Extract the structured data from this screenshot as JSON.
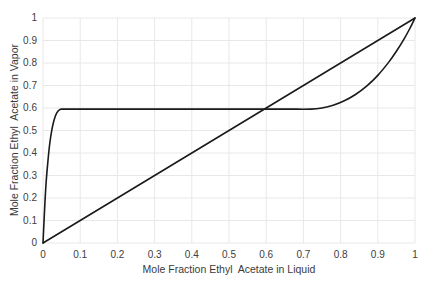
{
  "chart_data": {
    "type": "line",
    "title": "",
    "xlabel": "Mole Fraction Ethyl  Acetate in Liquid",
    "ylabel": "Mole Fraction Ethyl  Acetate in Vapor",
    "xlim": [
      0,
      1
    ],
    "ylim": [
      0,
      1
    ],
    "grid": true,
    "legend": "none",
    "xticks": [
      "0",
      "0.1",
      "0.2",
      "0.3",
      "0.4",
      "0.5",
      "0.6",
      "0.7",
      "0.8",
      "0.9",
      "1"
    ],
    "xtick_values": [
      0,
      0.1,
      0.2,
      0.3,
      0.4,
      0.5,
      0.6,
      0.7,
      0.8,
      0.9,
      1
    ],
    "yticks": [
      "0",
      "0.1",
      "0.2",
      "0.3",
      "0.4",
      "0.5",
      "0.6",
      "0.7",
      "0.8",
      "0.9",
      "1"
    ],
    "ytick_values": [
      0,
      0.1,
      0.2,
      0.3,
      0.4,
      0.5,
      0.6,
      0.7,
      0.8,
      0.9,
      1
    ],
    "series": [
      {
        "name": "equilibrium-curve",
        "color": "#1a1a1a",
        "x": [
          0,
          0.004,
          0.008,
          0.013,
          0.018,
          0.024,
          0.03,
          0.037,
          0.045,
          0.052,
          0.06,
          0.1,
          0.2,
          0.3,
          0.4,
          0.5,
          0.6,
          0.66,
          0.72,
          0.75,
          0.78,
          0.81,
          0.84,
          0.87,
          0.9,
          0.93,
          0.95,
          0.97,
          0.985,
          1.0
        ],
        "y": [
          0,
          0.14,
          0.26,
          0.36,
          0.44,
          0.505,
          0.548,
          0.578,
          0.593,
          0.595,
          0.595,
          0.595,
          0.595,
          0.595,
          0.595,
          0.595,
          0.595,
          0.595,
          0.595,
          0.6,
          0.612,
          0.632,
          0.66,
          0.697,
          0.745,
          0.805,
          0.852,
          0.905,
          0.95,
          1.0
        ]
      },
      {
        "name": "diagonal-yx-line",
        "color": "#1a1a1a",
        "x": [
          0,
          1
        ],
        "y": [
          0,
          1
        ]
      }
    ],
    "annotations": {
      "plateau_value": 0.595,
      "plateau_start_x": 0.052,
      "plateau_end_x": 0.72,
      "azeotrope_crossing_x": 0.6
    },
    "colors": {
      "curve": "#1a1a1a",
      "grid": "#e8e8e8",
      "background": "#ffffff",
      "text": "#3a3a3a"
    }
  }
}
